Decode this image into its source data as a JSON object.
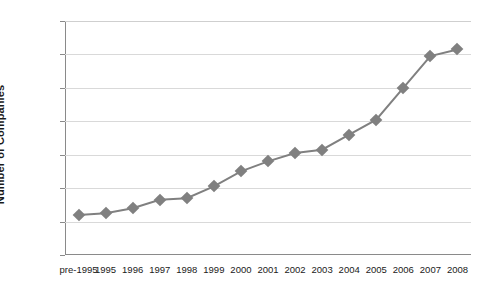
{
  "chart_data": {
    "type": "line",
    "title": "",
    "xlabel": "",
    "ylabel": "Number of Companies",
    "categories": [
      "pre-1995",
      "1995",
      "1996",
      "1997",
      "1998",
      "1999",
      "2000",
      "2001",
      "2002",
      "2003",
      "2004",
      "2005",
      "2006",
      "2007",
      "2008"
    ],
    "values": [
      24,
      25,
      28,
      33,
      34,
      41,
      50,
      56,
      61,
      63,
      72,
      81,
      100,
      119,
      123
    ],
    "ylim": [
      0,
      140
    ],
    "yticks": [
      0,
      20,
      40,
      60,
      80,
      100,
      120,
      140
    ],
    "ytick_labels": [
      "0",
      "20",
      "40",
      "60",
      "80",
      "100",
      "120",
      "140"
    ],
    "grid": true,
    "legend": false,
    "series_color": "#808080",
    "marker": "diamond",
    "gridline_color": "#d9d9d9",
    "axis_color": "#8a8a8a",
    "text_color": "#1a1a1a",
    "background": "#ffffff"
  }
}
